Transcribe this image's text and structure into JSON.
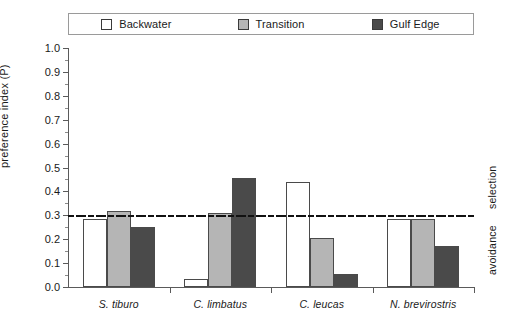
{
  "chart_data": {
    "type": "bar",
    "title": "",
    "xlabel": "",
    "ylabel": "preference index (P)",
    "ylim": [
      0.0,
      1.0
    ],
    "ytick_step": 0.1,
    "ytick_labels": [
      "0.0",
      "0.1",
      "0.2",
      "0.3",
      "0.4",
      "0.5",
      "0.6",
      "0.7",
      "0.8",
      "0.9",
      "1.0"
    ],
    "ytick_values": [
      0.0,
      0.1,
      0.2,
      0.3,
      0.4,
      0.5,
      0.6,
      0.7,
      0.8,
      0.9,
      1.0
    ],
    "grid": false,
    "legend_position": "top",
    "categories": [
      "S. tiburo",
      "C. limbatus",
      "C. leucas",
      "N. brevirostris"
    ],
    "series": [
      {
        "name": "Backwater",
        "color": "#ffffff",
        "values": [
          0.285,
          0.035,
          0.44,
          0.285
        ]
      },
      {
        "name": "Transition",
        "color": "#b5b5b5",
        "values": [
          0.32,
          0.31,
          0.205,
          0.285
        ]
      },
      {
        "name": "Gulf Edge",
        "color": "#4a4a4a",
        "values": [
          0.25,
          0.455,
          0.055,
          0.17
        ]
      }
    ],
    "reference_line": {
      "value": 0.3,
      "style": "dash-dot",
      "color": "#111111"
    },
    "annotations": [
      {
        "text": "selection",
        "position": "right-above-reference-line",
        "rotation": -90
      },
      {
        "text": "avoidance",
        "position": "right-below-reference-line",
        "rotation": -90
      }
    ]
  }
}
